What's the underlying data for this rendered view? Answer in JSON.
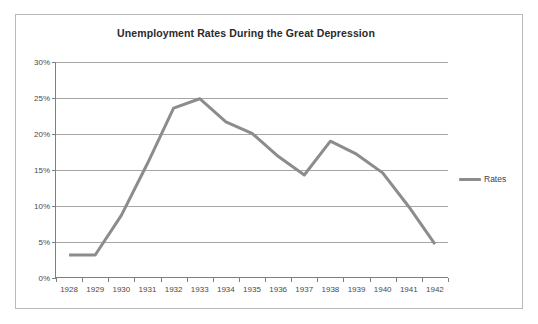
{
  "chart_data": {
    "type": "line",
    "title": "Unemployment Rates During the Great Depression",
    "xlabel": "",
    "ylabel": "",
    "categories": [
      "1928",
      "1929",
      "1930",
      "1931",
      "1932",
      "1933",
      "1934",
      "1935",
      "1936",
      "1937",
      "1938",
      "1939",
      "1940",
      "1941",
      "1942"
    ],
    "series": [
      {
        "name": "Rates",
        "color": "#8c8c8c",
        "values": [
          3.2,
          3.2,
          8.7,
          15.9,
          23.6,
          24.9,
          21.7,
          20.1,
          16.9,
          14.3,
          19.0,
          17.2,
          14.6,
          9.9,
          4.7
        ]
      }
    ],
    "ylim": [
      0,
      30
    ],
    "ytick_step": 5,
    "ytick_labels": [
      "0%",
      "5%",
      "10%",
      "15%",
      "20%",
      "25%",
      "30%"
    ],
    "grid": "horizontal",
    "legend_position": "right",
    "plot_background": "#ffffff",
    "gridline_color": "#a6a6a6",
    "axis_color": "#7f7f7f",
    "border_color": "#b9b9b9"
  },
  "legend": {
    "entries": [
      {
        "label": "Rates"
      }
    ]
  }
}
